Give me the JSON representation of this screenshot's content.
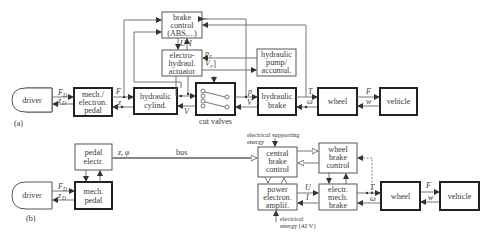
{
  "diagram_a": {
    "label": "(a)",
    "blocks": {
      "driver": "driver",
      "pedal": [
        "mech./",
        "electron.",
        "pedal"
      ],
      "cylinder": [
        "hydraulic",
        "cylind."
      ],
      "brake_control": [
        "brake",
        "control",
        "(ABS,...)"
      ],
      "actuator": [
        "electro-",
        "hydraul.",
        "actuator"
      ],
      "pump": [
        "hydraulic",
        "pump/",
        "accumul."
      ],
      "cut_valves": "cut valves",
      "hydraulic_brake": [
        "hydraulic",
        "brake"
      ],
      "wheel": "wheel",
      "vehicle": "vehicle"
    },
    "signals": {
      "FD": "F",
      "FD_sub": "D",
      "zD": "z",
      "zD_sub": "D",
      "F_pedal": "F",
      "z_pedal": "z",
      "U": "U",
      "I": "I",
      "pP": "p",
      "pP_sub": "P",
      "VP": "V",
      "VP_sub": "P",
      "p": "p",
      "V": "V",
      "V_cyl": "V",
      "T": "T",
      "omega": "ω",
      "F_wheel": "F",
      "w": "w"
    }
  },
  "diagram_b": {
    "label": "(b)",
    "blocks": {
      "driver": "driver",
      "pedal_electr": [
        "pedal",
        "electr."
      ],
      "mech_pedal": [
        "mech.",
        "pedal"
      ],
      "central_brake_control": [
        "central",
        "brake",
        "control"
      ],
      "wheel_brake_control": [
        "wheel",
        "brake",
        "control"
      ],
      "power_amplif": [
        "power",
        "electron.",
        "amplif."
      ],
      "electr_mech_brake": [
        "electr.",
        "mech.",
        "brake"
      ],
      "wheel": "wheel",
      "vehicle": "vehicle"
    },
    "annotations": {
      "bus": "bus",
      "z_phi": "z, φ",
      "supporting_energy_1": "electrical  supporting",
      "supporting_energy_2": "energy",
      "energy_42v_1": "electrical",
      "energy_42v_2": "energy (42 V)"
    },
    "signals": {
      "FD": "F",
      "FD_sub": "D",
      "zD": "z",
      "zD_sub": "D",
      "U": "U",
      "I": "I",
      "T": "T",
      "omega": "ω",
      "F_wheel": "F",
      "w": "w"
    }
  }
}
